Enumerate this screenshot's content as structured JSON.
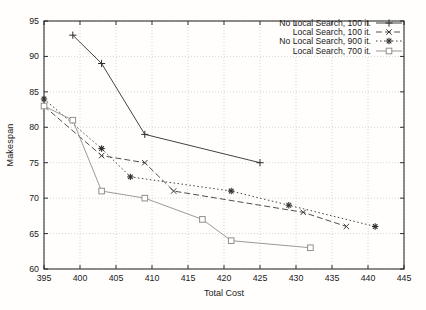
{
  "chart_data": {
    "type": "line",
    "title": "",
    "xlabel": "Total Cost",
    "ylabel": "Makespan",
    "xlim": [
      395,
      445
    ],
    "ylim": [
      60,
      95
    ],
    "xticks": [
      395,
      400,
      405,
      410,
      415,
      420,
      425,
      430,
      435,
      440,
      445
    ],
    "yticks": [
      60,
      65,
      70,
      75,
      80,
      85,
      90,
      95
    ],
    "grid": true,
    "legend_position": "top-right-inside",
    "frame_color": "#1c1c1c",
    "grid_color": "#c6c6c6",
    "series": [
      {
        "name": "No Local Search, 100 it.",
        "marker": "plus",
        "line": "solid",
        "color": "#2e2e2e",
        "points": [
          [
            399,
            93
          ],
          [
            403,
            89
          ],
          [
            409,
            79
          ],
          [
            425,
            75
          ]
        ]
      },
      {
        "name": "Local Search, 100 it.",
        "marker": "cross",
        "line": "dashed",
        "color": "#3a3a3a",
        "points": [
          [
            395,
            83
          ],
          [
            403,
            76
          ],
          [
            409,
            75
          ],
          [
            413,
            71
          ],
          [
            431,
            68
          ],
          [
            437,
            66
          ]
        ]
      },
      {
        "name": "No Local Search, 900 it.",
        "marker": "asterisk",
        "line": "dotted",
        "color": "#303030",
        "points": [
          [
            395,
            84
          ],
          [
            403,
            77
          ],
          [
            407,
            73
          ],
          [
            421,
            71
          ],
          [
            429,
            69
          ],
          [
            441,
            66
          ]
        ]
      },
      {
        "name": "Local Search, 700 it.",
        "marker": "square",
        "line": "solid",
        "color": "#8f8f8f",
        "points": [
          [
            395,
            83
          ],
          [
            399,
            81
          ],
          [
            403,
            71
          ],
          [
            409,
            70
          ],
          [
            417,
            67
          ],
          [
            421,
            64
          ],
          [
            432,
            63
          ]
        ]
      }
    ]
  }
}
